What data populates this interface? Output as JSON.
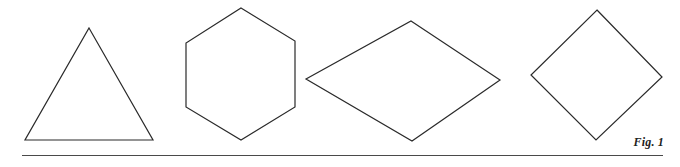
{
  "figure": {
    "caption": "Fig. 1",
    "stroke_color": "#2a2a2a",
    "rule_color": "#4a4a4a",
    "background": "#ffffff",
    "shapes": [
      {
        "name": "triangle",
        "type": "equilateral-triangle",
        "points": "89,28 153,140 25,140"
      },
      {
        "name": "hexagon",
        "type": "regular-hexagon",
        "points": "241,8 295,41 295,107 241,140 186,107 186,43"
      },
      {
        "name": "rhombus",
        "type": "rhombus",
        "points": "411,21 500,80 412,141 306,79"
      },
      {
        "name": "square",
        "type": "square-rotated-45",
        "points": "597,10 662,77 596,140 531,75"
      }
    ]
  }
}
